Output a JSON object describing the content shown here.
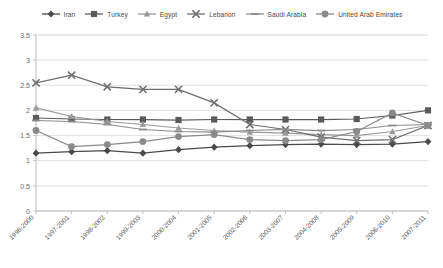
{
  "chart_data": {
    "type": "line",
    "title": "",
    "xlabel": "",
    "ylabel": "",
    "ylim": [
      0,
      3.5
    ],
    "ytick_step": 0.5,
    "yticks": [
      "0",
      "0.5",
      "1",
      "1.5",
      "2",
      "2.5",
      "3",
      "3.5"
    ],
    "grid": true,
    "legend_position": "top",
    "categories": [
      "1996-2000",
      "1997-2001",
      "1998-2002",
      "1999-2003",
      "2000-2004",
      "2001-2005",
      "2002-2006",
      "2003-2007",
      "2004-2008",
      "2005-2009",
      "2006-2010",
      "2007-2011"
    ],
    "series": [
      {
        "name": "Iran",
        "marker": "diamond",
        "color": "#4a4a4a",
        "values": [
          1.15,
          1.18,
          1.2,
          1.15,
          1.22,
          1.27,
          1.3,
          1.32,
          1.33,
          1.32,
          1.33,
          1.38
        ]
      },
      {
        "name": "Turkey",
        "marker": "square",
        "color": "#5a5a5a",
        "values": [
          1.85,
          1.83,
          1.82,
          1.82,
          1.81,
          1.82,
          1.82,
          1.82,
          1.82,
          1.83,
          1.9,
          2.0
        ]
      },
      {
        "name": "Egypt",
        "marker": "triangle",
        "color": "#9a9a9a",
        "values": [
          2.05,
          1.88,
          1.78,
          1.72,
          1.65,
          1.6,
          1.57,
          1.55,
          1.52,
          1.5,
          1.58,
          1.7
        ]
      },
      {
        "name": "Lebanon",
        "marker": "cross",
        "color": "#6e6e6e",
        "values": [
          2.55,
          2.7,
          2.47,
          2.42,
          2.42,
          2.15,
          1.72,
          1.62,
          1.47,
          1.4,
          1.42,
          1.7
        ]
      },
      {
        "name": "Saudi Arabia",
        "marker": "dash",
        "color": "#8c8c8c",
        "values": [
          1.8,
          1.78,
          1.72,
          1.62,
          1.58,
          1.57,
          1.6,
          1.62,
          1.6,
          1.62,
          1.7,
          1.72
        ]
      },
      {
        "name": "United Arab Emirates",
        "marker": "circle",
        "color": "#8a8a8a",
        "values": [
          1.6,
          1.28,
          1.32,
          1.38,
          1.48,
          1.52,
          1.42,
          1.4,
          1.42,
          1.58,
          1.95,
          1.7
        ]
      }
    ]
  },
  "legend": {
    "items": [
      {
        "label": "Iran"
      },
      {
        "label": "Turkey"
      },
      {
        "label": "Egypt"
      },
      {
        "label": "Lebanon"
      },
      {
        "label": "Saudi Arabia"
      },
      {
        "label": "United Arab Emirates"
      }
    ]
  },
  "axes": {
    "y_tick_labels": [
      "3.5",
      "3",
      "2.5",
      "2",
      "1.5",
      "1",
      "0.5",
      "0"
    ],
    "x_tick_labels": [
      "1996-2000",
      "1997-2001",
      "1998-2002",
      "1999-2003",
      "2000-2004",
      "2001-2005",
      "2002-2006",
      "2003-2007",
      "2004-2008",
      "2005-2009",
      "2006-2010",
      "2007-2011"
    ]
  }
}
